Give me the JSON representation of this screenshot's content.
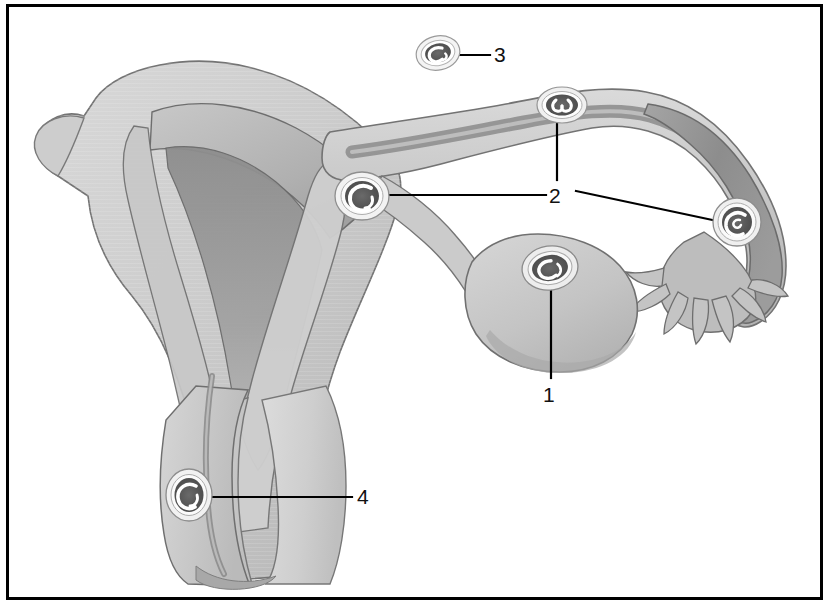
{
  "figure": {
    "style": "grayscale medical line-and-wash illustration",
    "border_color": "#000000",
    "background_color": "#ffffff",
    "leader_line_color": "#000000"
  },
  "palette": {
    "outline": "#6f6f6f",
    "outline_dark": "#4a4a4a",
    "tissue_light": "#dcdcdc",
    "tissue_mid": "#c9c9c9",
    "tissue_mid2": "#bdbdbd",
    "tissue_dark": "#a7a7a7",
    "cavity_shadow": "#8f8f8f",
    "tube_lumen_dark": "#8a8a8a",
    "embryo_dark": "#4f4f4f",
    "embryo_halo": "#f2f2f2",
    "label_text": "#111111"
  },
  "labels": [
    {
      "id": "1",
      "text": "1",
      "x": 551,
      "y": 395,
      "target_site": "ovarian-implantation-site",
      "leader": "vertical line rising from the numeral up to the marker on the ovary"
    },
    {
      "id": "2",
      "text": "2",
      "x": 557,
      "y": 196,
      "target_site": "tubal-implantation-sites",
      "leader": "three leader lines: one up to the mid-tubal marker, one left to the interstitial/cornual marker, one right-down to the ampullary/fimbrial marker"
    },
    {
      "id": "3",
      "text": "3",
      "x": 501,
      "y": 55,
      "target_site": "abdominal-free-ovum",
      "leader": "short horizontal line running left to the free-floating conceptus"
    },
    {
      "id": "4",
      "text": "4",
      "x": 365,
      "y": 497,
      "target_site": "cervical-implantation-site",
      "leader": "horizontal line running left to the marker in the cervical canal wall"
    }
  ],
  "implantation_markers": [
    {
      "name": "abdominal-free-ovum-marker",
      "label_id": "3",
      "cx": 438,
      "cy": 53,
      "rx": 22,
      "ry": 17,
      "rotation": -12,
      "description": "free conceptus in the peritoneal cavity above the tube"
    },
    {
      "name": "mid-tubal-implantation-marker",
      "label_id": "2",
      "cx": 562,
      "cy": 105,
      "rx": 24,
      "ry": 17,
      "rotation": 0,
      "description": "isthmic / mid-ampullary tubal implantation"
    },
    {
      "name": "interstitial-implantation-marker",
      "label_id": "2",
      "cx": 362,
      "cy": 196,
      "rx": 25,
      "ry": 22,
      "rotation": 0,
      "description": "interstitial / cornual implantation at the uterotubal junction"
    },
    {
      "name": "ampullary-implantation-marker",
      "label_id": "2",
      "cx": 737,
      "cy": 222,
      "rx": 22,
      "ry": 22,
      "rotation": 0,
      "description": "ampullary / infundibular implantation near the fimbriae"
    },
    {
      "name": "ovarian-implantation-marker",
      "label_id": "1",
      "cx": 550,
      "cy": 268,
      "rx": 26,
      "ry": 21,
      "rotation": -8,
      "description": "ovarian implantation on the surface of the ovary"
    },
    {
      "name": "cervical-implantation-marker",
      "label_id": "4",
      "cx": 189,
      "cy": 495,
      "rx": 21,
      "ry": 24,
      "rotation": 0,
      "description": "cervical implantation within the cervical canal"
    }
  ],
  "anatomy": [
    {
      "name": "uterine-fundus-and-body",
      "description": "large uterus shown in coronal cut-away at left"
    },
    {
      "name": "myometrium-outer-wall",
      "description": "outer muscular wall of the uterus"
    },
    {
      "name": "endometrial-cavity",
      "description": "triangular shaded uterine cavity"
    },
    {
      "name": "round-ligament-stub",
      "description": "small projection at the far left of the fundus"
    },
    {
      "name": "left-fallopian-tube",
      "description": "tube sweeping right from the uterine cornu"
    },
    {
      "name": "tubal-ampulla",
      "description": "dilated dark-lumen distal tube at the right"
    },
    {
      "name": "fimbriae",
      "description": "finger-like projections at the distal end of the tube"
    },
    {
      "name": "ovary",
      "description": "oval organ below the tube, centre-right"
    },
    {
      "name": "ovarian-ligament",
      "description": "band joining the ovary toward the uterus"
    },
    {
      "name": "cervix",
      "description": "lower narrow segment of the uterus"
    },
    {
      "name": "cervical-canal",
      "description": "narrow channel through the cervix"
    },
    {
      "name": "vagina",
      "description": "broad lower canal below the cervix"
    }
  ]
}
